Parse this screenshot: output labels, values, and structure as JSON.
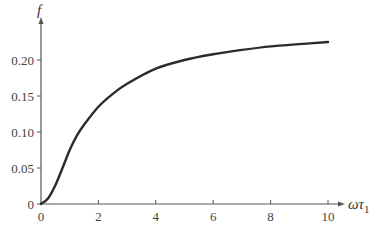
{
  "chart_data": {
    "type": "line",
    "title": "",
    "xlabel": "ωτ1",
    "xlabel_main": "ωτ",
    "xlabel_sub": "1",
    "ylabel": "f",
    "xlim": [
      0,
      10
    ],
    "ylim": [
      0,
      0.25
    ],
    "grid": false,
    "legend": null,
    "x_ticks": [
      0,
      2,
      4,
      6,
      8,
      10
    ],
    "x_tick_labels": [
      "0",
      "2",
      "4",
      "6",
      "8",
      "10"
    ],
    "y_ticks": [
      0,
      0.05,
      0.1,
      0.15,
      0.2
    ],
    "y_tick_labels": [
      "0",
      "0.05",
      "0.10",
      "0.15",
      "0.20"
    ],
    "series": [
      {
        "name": "f",
        "x": [
          0,
          0.25,
          0.5,
          0.75,
          1,
          1.25,
          1.5,
          2,
          2.5,
          3,
          4,
          5,
          6,
          7,
          8,
          9,
          10
        ],
        "y": [
          0,
          0.008,
          0.026,
          0.05,
          0.075,
          0.095,
          0.11,
          0.135,
          0.153,
          0.167,
          0.188,
          0.2,
          0.208,
          0.214,
          0.219,
          0.222,
          0.225
        ]
      }
    ],
    "line_color": "#2b2b2b"
  }
}
